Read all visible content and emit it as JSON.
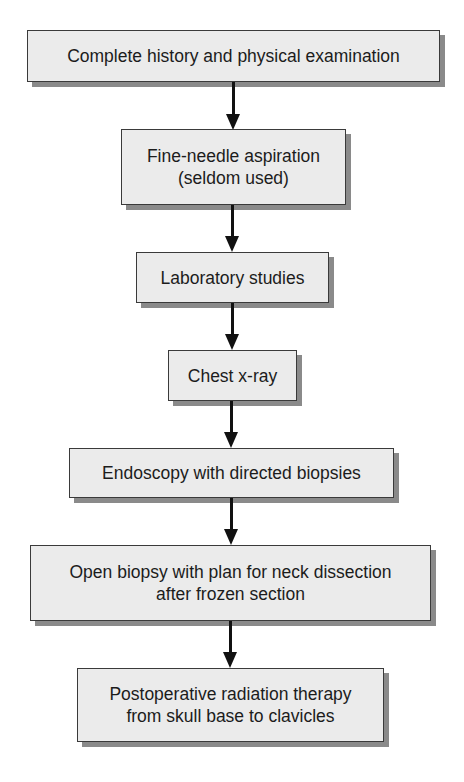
{
  "flowchart": {
    "steps": [
      {
        "lines": [
          "Complete history and physical examination"
        ]
      },
      {
        "lines": [
          "Fine-needle aspiration",
          "(seldom used)"
        ]
      },
      {
        "lines": [
          "Laboratory studies"
        ]
      },
      {
        "lines": [
          "Chest x-ray"
        ]
      },
      {
        "lines": [
          "Endoscopy with directed biopsies"
        ]
      },
      {
        "lines": [
          "Open biopsy with plan for neck dissection",
          "after frozen section"
        ]
      },
      {
        "lines": [
          "Postoperative radiation therapy",
          "from skull base to clavicles"
        ]
      }
    ],
    "colors": {
      "box_fill": "#ebebeb",
      "box_border": "#3a3a3a",
      "shadow": "#8a8a8a",
      "arrow": "#111111"
    }
  }
}
